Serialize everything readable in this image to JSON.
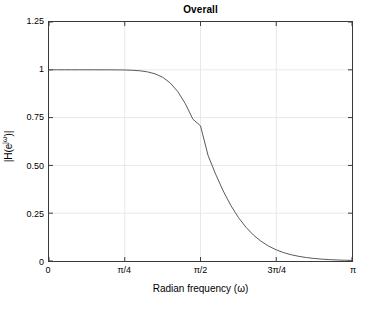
{
  "chart_data": {
    "type": "line",
    "title": "Overall",
    "xlabel": "Radian frequency (ω)",
    "ylabel_text": "|H(e",
    "ylabel_sup": "jω",
    "ylabel_tail": ")|",
    "ylabel_full": "|H(e^{jω})|",
    "xlim": [
      0,
      3.14159265
    ],
    "ylim": [
      0,
      1.25
    ],
    "grid": true,
    "legend": "none",
    "line_color": "#5a5a5a",
    "axis_color": "#3a3a3a",
    "grid_color": "#e8e8e8",
    "background": "#ffffff",
    "xticks": [
      {
        "value": 0.0,
        "label": "0"
      },
      {
        "value": 0.78539816,
        "label": "π/4"
      },
      {
        "value": 1.57079633,
        "label": "π/2"
      },
      {
        "value": 2.35619449,
        "label": "3π/4"
      },
      {
        "value": 3.14159265,
        "label": "π"
      }
    ],
    "yticks": [
      {
        "value": 0.0,
        "label": "0"
      },
      {
        "value": 0.25,
        "label": "0.25"
      },
      {
        "value": 0.5,
        "label": "0.50"
      },
      {
        "value": 0.75,
        "label": "0.75"
      },
      {
        "value": 1.0,
        "label": "1"
      },
      {
        "value": 1.25,
        "label": "1.25"
      }
    ],
    "series": [
      {
        "name": "|H(e^{jω})|",
        "description": "Butterworth lowpass magnitude response, cutoff ωc = π/2",
        "x": [
          0.0,
          0.0785,
          0.1571,
          0.2356,
          0.3142,
          0.3927,
          0.4712,
          0.5498,
          0.6283,
          0.7069,
          0.7854,
          0.8639,
          0.9425,
          1.021,
          1.0996,
          1.1781,
          1.2566,
          1.3352,
          1.4137,
          1.4923,
          1.5708,
          1.6493,
          1.7279,
          1.8064,
          1.885,
          1.9635,
          2.042,
          2.1206,
          2.1991,
          2.2777,
          2.3562,
          2.4347,
          2.5133,
          2.5918,
          2.6704,
          2.7489,
          2.8274,
          2.906,
          2.9845,
          3.0631,
          3.1416
        ],
        "y": [
          1.0,
          1.0,
          1.0,
          1.0,
          1.0,
          1.0,
          1.0,
          0.9999,
          0.9999,
          0.9996,
          0.999,
          0.9976,
          0.9948,
          0.9892,
          0.9789,
          0.9609,
          0.9313,
          0.8861,
          0.8225,
          0.7415,
          0.7071,
          0.5519,
          0.454,
          0.3662,
          0.2907,
          0.2278,
          0.1765,
          0.1353,
          0.1029,
          0.0777,
          0.0583,
          0.0436,
          0.0325,
          0.0241,
          0.0179,
          0.0133,
          0.0098,
          0.0073,
          0.0054,
          0.004,
          0.003
        ]
      }
    ],
    "annotations": {
      "cutoff_frequency": "π/2",
      "cutoff_magnitude": 0.707,
      "passband_gain": 1.0
    }
  }
}
